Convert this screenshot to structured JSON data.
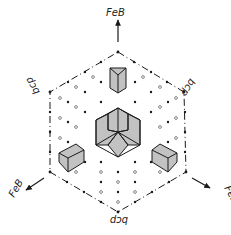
{
  "diagram": {
    "type": "crystal-orientation-diagram",
    "center": [
      118,
      132
    ],
    "labels": {
      "top": "FeB",
      "lower_left": "FeB",
      "lower_right": "FeB",
      "upper_left": "bcp",
      "upper_right": "bcp",
      "bottom": "bcp"
    },
    "colors": {
      "ink": "#1a1a1a",
      "background": "#ffffff"
    }
  }
}
